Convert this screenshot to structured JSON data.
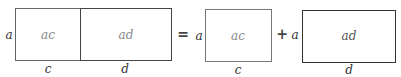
{
  "diagram": {
    "left_group": {
      "side_label": "a",
      "cells": [
        {
          "label": "ac",
          "bottom_label": "c"
        },
        {
          "label": "ad",
          "bottom_label": "d"
        }
      ]
    },
    "equals": "=",
    "right_terms": [
      {
        "side_label": "a",
        "label": "ac",
        "bottom_label": "c"
      },
      {
        "side_label": "a",
        "label": "ad",
        "bottom_label": "d"
      }
    ],
    "plus": "+",
    "colors": {
      "line": "#555555",
      "line_dark": "#333333",
      "inner_text": "#888888",
      "text": "#333333"
    }
  }
}
